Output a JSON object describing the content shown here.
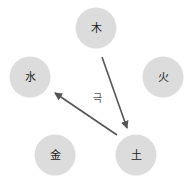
{
  "diagram": {
    "title": "",
    "colors": {
      "node_fill": "#dcdcdc",
      "arrow": "#555555",
      "text": "#222222"
    },
    "nodes": [
      {
        "id": "wood",
        "label": "木",
        "cx": 96,
        "cy": 28
      },
      {
        "id": "fire",
        "label": "火",
        "cx": 163,
        "cy": 77
      },
      {
        "id": "water",
        "label": "水",
        "cx": 30,
        "cy": 77
      },
      {
        "id": "metal",
        "label": "金",
        "cx": 55,
        "cy": 155
      },
      {
        "id": "earth",
        "label": "土",
        "cx": 136,
        "cy": 155
      }
    ],
    "edges": [
      {
        "from": "木",
        "to": "土"
      },
      {
        "from": "土",
        "to": "水"
      }
    ],
    "relation_label": "극"
  }
}
